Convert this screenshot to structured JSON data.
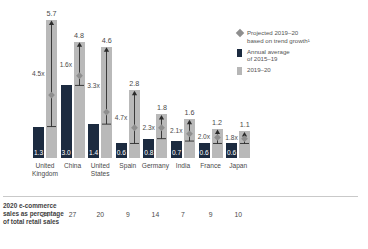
{
  "legend": {
    "items": [
      {
        "icon": "diamond-marker-icon",
        "swatch": "diamond",
        "line1": "Projected 2019–20",
        "line2": "based on trend growth¹",
        "color": "#8e8e8e"
      },
      {
        "icon": "dark-bar-swatch-icon",
        "swatch": "dark",
        "line1": "Annual average",
        "line2": "of 2015–19",
        "color": "#1c2b40"
      },
      {
        "icon": "light-bar-swatch-icon",
        "swatch": "light",
        "line1": "2019–20",
        "line2": "",
        "color": "#b6b6b6"
      }
    ]
  },
  "footer": {
    "label_line1": "2020 e-commerce",
    "label_line2": "sales as percentage",
    "label_line3": "of total retail sales"
  },
  "chart_data": {
    "type": "bar",
    "title": "",
    "subtitle": "",
    "xlabel": "",
    "ylabel": "",
    "ylim": [
      0,
      6.2
    ],
    "grid": false,
    "legend_position": "top-right",
    "categories": [
      "United Kingdom",
      "China",
      "United States",
      "Spain",
      "Germany",
      "India",
      "France",
      "Japan"
    ],
    "category_lines": [
      [
        "United",
        "Kingdom"
      ],
      [
        "China",
        ""
      ],
      [
        "United",
        "States"
      ],
      [
        "Spain",
        ""
      ],
      [
        "Germany",
        ""
      ],
      [
        "India",
        ""
      ],
      [
        "France",
        ""
      ],
      [
        "Japan",
        ""
      ]
    ],
    "series": [
      {
        "name": "Annual average of 2015–19",
        "color": "#1c2b40",
        "values": [
          1.3,
          3.0,
          1.4,
          0.6,
          0.8,
          0.7,
          0.6,
          0.6
        ]
      },
      {
        "name": "2019–20",
        "color": "#b9b9b9",
        "values": [
          5.7,
          4.8,
          4.6,
          2.8,
          1.8,
          1.6,
          1.2,
          1.1
        ]
      }
    ],
    "multipliers": [
      "4.5x",
      "1.6x",
      "3.3x",
      "4.7x",
      "2.3x",
      "2.1x",
      "2.0x",
      "1.8x"
    ],
    "projected_markers": [
      2.6,
      3.4,
      1.9,
      1.25,
      1.25,
      1.0,
      0.85,
      0.8
    ],
    "annotations": {
      "row_label": "2020 e-commerce sales as percentage of total retail sales",
      "row_values": [
        24,
        27,
        20,
        9,
        14,
        7,
        9,
        10
      ]
    }
  }
}
